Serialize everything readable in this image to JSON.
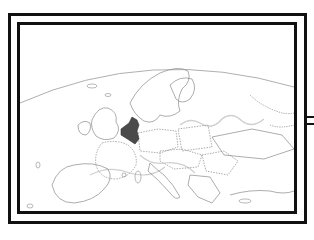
{
  "map": {
    "region": "Europe",
    "highlighted_region": "Benelux",
    "colors": {
      "highlight": "#4a4a4a",
      "border_line": "#8a8a8a",
      "river_line": "#c8c8c8",
      "frame": "#111111",
      "background": "#ffffff"
    }
  }
}
